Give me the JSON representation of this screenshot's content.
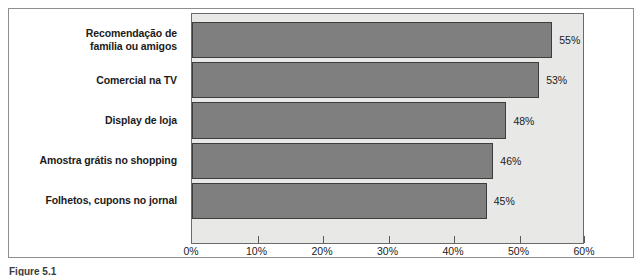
{
  "caption": "Figure 5.1",
  "chart_data": {
    "type": "bar",
    "orientation": "horizontal",
    "title": "",
    "subtitle": "",
    "xlabel": "",
    "ylabel": "",
    "categories": [
      "Recomendação de\nfamília ou amigos",
      "Comercial na TV",
      "Display de loja",
      "Amostra grátis no shopping",
      "Folhetos, cupons no jornal"
    ],
    "values": [
      55,
      53,
      48,
      46,
      45
    ],
    "data_labels": [
      "55%",
      "53%",
      "48%",
      "46%",
      "45%"
    ],
    "xlim": [
      0,
      60
    ],
    "xticks": [
      0,
      10,
      20,
      30,
      40,
      50,
      60
    ],
    "xtick_labels": [
      "0%",
      "10%",
      "20%",
      "30%",
      "40%",
      "50%",
      "60%"
    ],
    "grid": false,
    "legend": false,
    "colors": {
      "bar_fill": "#7f7f7f",
      "bar_border": "#3d3d3d",
      "plot_background": "#e8e8e6",
      "plot_border": "#6a6a6a",
      "figure_border": "#8e8e8e",
      "text": "#1b1b1b",
      "page_background": "#ffffff"
    }
  }
}
